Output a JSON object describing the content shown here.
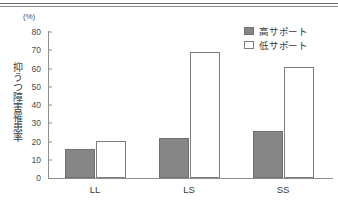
{
  "chart_data": {
    "type": "bar",
    "title": "",
    "subtitle": "",
    "xlabel": "",
    "ylabel": "抑うつ障害罹患率",
    "unit_label": "(%)",
    "categories": [
      "LL",
      "LS",
      "SS"
    ],
    "series": [
      {
        "name": "高サポート",
        "values": [
          16,
          22,
          26
        ],
        "fill": "#868686",
        "border": "#6f6f6f"
      },
      {
        "name": "低サポート",
        "values": [
          20,
          69,
          61
        ],
        "fill": "#ffffff",
        "border": "#7d7d7d"
      }
    ],
    "ylim": [
      0,
      80
    ],
    "yticks": [
      0,
      10,
      20,
      30,
      40,
      50,
      60,
      70,
      80
    ],
    "ytick_labels": [
      "0",
      "10",
      "20",
      "30",
      "40",
      "50",
      "60",
      "70",
      "80"
    ],
    "grid": false,
    "legend_position": "top-right",
    "annotations": []
  },
  "legend": {
    "items": [
      {
        "label": "高サポート",
        "style": "filled"
      },
      {
        "label": "低サポート",
        "style": "outline"
      }
    ]
  },
  "decorations": {
    "top_rule_count": 2
  }
}
